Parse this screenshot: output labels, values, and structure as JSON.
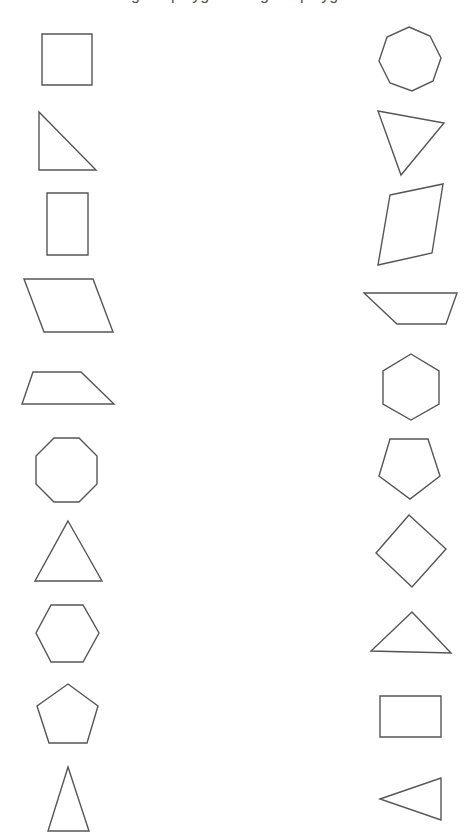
{
  "page": {
    "title_clipped": "Irregular polygons         Regular polygons",
    "stroke_color": "#555555",
    "background": "#ffffff"
  },
  "left_column": [
    {
      "name": "square",
      "points": "42,34 92,34 92,85 42,85"
    },
    {
      "name": "right-triangle",
      "points": "39,112 96,170 39,170"
    },
    {
      "name": "rectangle-portrait",
      "points": "47,193 88,193 88,255 47,255"
    },
    {
      "name": "parallelogram",
      "points": "24,279 93,279 113,332 44,332"
    },
    {
      "name": "trapezoid",
      "points": "33,372 81,372 114,404 22,404"
    },
    {
      "name": "octagon",
      "points": "54,438 79,438 97,456 97,484 79,502 54,502 36,484 36,456"
    },
    {
      "name": "equilateral-triangle",
      "points": "68,521 102,581 35,581"
    },
    {
      "name": "hexagon",
      "points": "51,605 83,605 99,633 83,662 51,662 36,633"
    },
    {
      "name": "pentagon",
      "points": "68,684 98,706 87,743 49,743 37,706"
    },
    {
      "name": "isosceles-triangle",
      "points": "68,767 89,831 48,831"
    }
  ],
  "right_column": [
    {
      "name": "rotated-octagon",
      "points": "409,27 430,36 441,58 433,81 412,91 390,83 379,61 387,37"
    },
    {
      "name": "scalene-triangle",
      "points": "378,111 444,123 401,175"
    },
    {
      "name": "rhombus",
      "points": "390,195 443,184 432,253 378,265"
    },
    {
      "name": "inverted-trapezoid",
      "points": "364,293 457,293 446,324 397,324"
    },
    {
      "name": "hexagon-pointy",
      "points": "411,354 439,371 439,404 411,420 383,404 383,371"
    },
    {
      "name": "inverted-pentagon",
      "points": "390,439 428,439 440,476 410,499 379,476"
    },
    {
      "name": "diamond",
      "points": "409,515 446,549 412,587 376,553"
    },
    {
      "name": "obtuse-triangle",
      "points": "412,612 451,653 371,651"
    },
    {
      "name": "rectangle-landscape",
      "points": "380,696 441,696 441,737 380,737"
    },
    {
      "name": "left-pointing-triangle",
      "points": "380,799 441,778 441,820"
    }
  ]
}
